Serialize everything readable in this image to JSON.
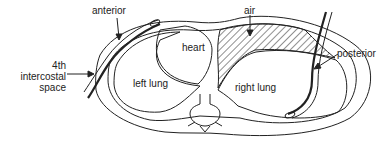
{
  "diagram": {
    "labels": {
      "anterior": "anterior",
      "air": "air",
      "heart": "heart",
      "posterior": "posterior",
      "intercostal_line1": "4th",
      "intercostal_line2": "intercostal",
      "intercostal_line3": "space",
      "left_lung": "left lung",
      "right_lung": "right lung"
    },
    "colors": {
      "line": "#222222",
      "background": "#ffffff"
    }
  }
}
